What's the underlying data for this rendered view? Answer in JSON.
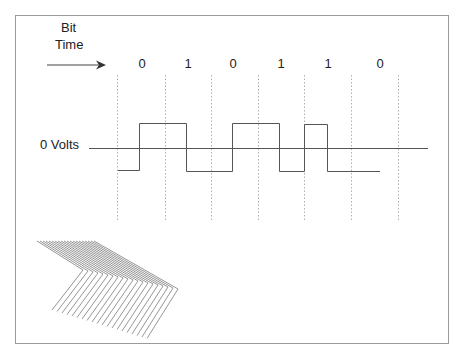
{
  "diagram": {
    "title_line1": "Bit",
    "title_line2": "Time",
    "voltage_label": "0 Volts",
    "bits": [
      "0",
      "1",
      "0",
      "1",
      "1",
      "0"
    ],
    "colors": {
      "frame": "#9a9a9a",
      "line": "#555555",
      "dotted": "#b0b0b0",
      "text": "#222222",
      "chevron": "#8a8a8a"
    }
  }
}
